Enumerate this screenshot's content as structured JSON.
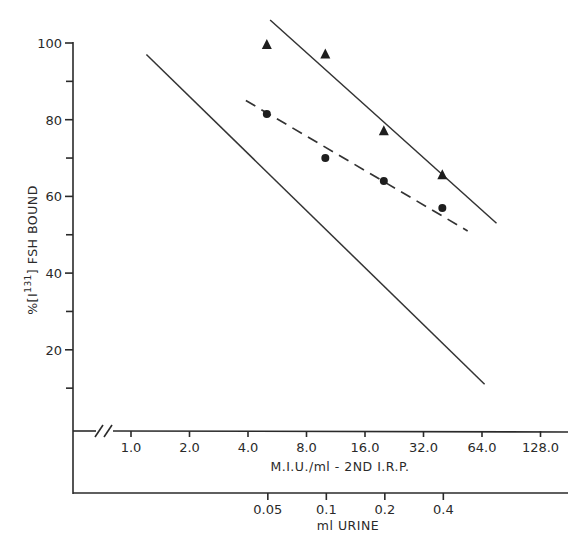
{
  "chart_data": {
    "type": "scatter",
    "title": "",
    "ylabel": "%[I131] FSH BOUND",
    "ylabel_parts": {
      "prefix": "%[I",
      "superscript": "131",
      "suffix": "] FSH BOUND"
    },
    "xlabel": "M.I.U./ml - 2ND I.R.P.",
    "xlabel_secondary": "ml URINE",
    "ylim": [
      0,
      100
    ],
    "yticks": [
      20,
      40,
      60,
      80,
      100
    ],
    "yticks_minor": [
      10,
      30,
      50,
      70,
      90
    ],
    "xscale": "log2",
    "xticks": [
      "1.0",
      "2.0",
      "4.0",
      "8.0",
      "16.0",
      "32.0",
      "64.0",
      "128.0"
    ],
    "xticks_secondary": [
      "0.05",
      "0.1",
      "0.2",
      "0.4"
    ],
    "axis_break": true,
    "grid": false,
    "legend": null,
    "series": [
      {
        "name": "triangles (urine dilutions)",
        "marker": "triangle",
        "x_miu": [
          5.0,
          10.0,
          20.0,
          40.0
        ],
        "x_ml_urine": [
          0.05,
          0.1,
          0.2,
          0.4
        ],
        "y": [
          99.5,
          97,
          77,
          65.5
        ]
      },
      {
        "name": "circles (urine dilutions)",
        "marker": "circle",
        "x_miu": [
          5.0,
          10.0,
          20.0,
          40.0
        ],
        "x_ml_urine": [
          0.05,
          0.1,
          0.2,
          0.4
        ],
        "y": [
          81.5,
          70,
          64,
          57
        ]
      }
    ],
    "lines": [
      {
        "name": "standard curve (2nd IRP)",
        "style": "solid",
        "from": {
          "x": 1.2,
          "y": 97
        },
        "to": {
          "x": 66,
          "y": 11
        }
      },
      {
        "name": "triangle fit",
        "style": "solid",
        "from": {
          "x": 5.2,
          "y": 106
        },
        "to": {
          "x": 76,
          "y": 53
        }
      },
      {
        "name": "circle fit",
        "style": "dashed",
        "from": {
          "x": 3.9,
          "y": 85
        },
        "to": {
          "x": 54,
          "y": 51
        }
      }
    ]
  }
}
